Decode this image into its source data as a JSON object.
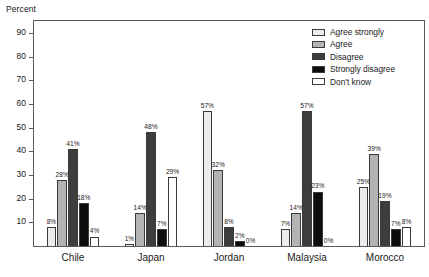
{
  "chart_data": {
    "type": "bar",
    "title": "",
    "xlabel": "",
    "ylabel": "Percent",
    "ylim": [
      0,
      95
    ],
    "yticks": [
      10,
      20,
      30,
      40,
      50,
      60,
      70,
      80,
      90
    ],
    "grid": false,
    "legend_position": "top-right",
    "categories": [
      "Chile",
      "Japan",
      "Jordan",
      "Malaysia",
      "Morocco"
    ],
    "series": [
      {
        "name": "Agree strongly",
        "color": "#ececec",
        "values": [
          8,
          1,
          57,
          7,
          25
        ],
        "labels": [
          "8%",
          "1%",
          "57%",
          "7%",
          "25%"
        ]
      },
      {
        "name": "Agree",
        "color": "#b3b3b3",
        "values": [
          28,
          14,
          32,
          14,
          39
        ],
        "labels": [
          "28%",
          "14%",
          "32%",
          "14%",
          "39%"
        ]
      },
      {
        "name": "Disagree",
        "color": "#3d3d3d",
        "values": [
          41,
          48,
          8,
          57,
          19
        ],
        "labels": [
          "41%",
          "48%",
          "8%",
          "57%",
          "19%"
        ]
      },
      {
        "name": "Strongly disagree",
        "color": "#0d0d0d",
        "values": [
          18,
          7,
          2,
          23,
          7
        ],
        "labels": [
          "18%",
          "7%",
          "2%",
          "23%",
          "7%"
        ]
      },
      {
        "name": "Don't know",
        "color": "#ffffff",
        "values": [
          4,
          29,
          0,
          0,
          8
        ],
        "labels": [
          "4%",
          "29%",
          "0%",
          "0%",
          "8%"
        ]
      }
    ]
  },
  "axis": {
    "y_title": "Percent",
    "y_tick_labels": [
      "90",
      "80",
      "70",
      "60",
      "50",
      "40",
      "30",
      "20",
      "10"
    ]
  },
  "legend": {
    "items": [
      {
        "label": "Agree strongly"
      },
      {
        "label": "Agree"
      },
      {
        "label": "Disagree"
      },
      {
        "label": "Strongly disagree"
      },
      {
        "label": "Don't know"
      }
    ]
  }
}
